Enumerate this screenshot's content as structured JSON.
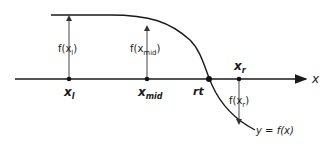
{
  "diagram": {
    "axis_label": "x",
    "curve_label": "y = f(x)",
    "points": {
      "x_l": {
        "base": "x",
        "sub": "l"
      },
      "x_mid": {
        "base": "x",
        "sub": "mid"
      },
      "rt": {
        "label": "rt"
      },
      "x_r": {
        "base": "x",
        "sub": "r"
      }
    },
    "arrow_labels": {
      "f_xl": {
        "prefix": "f(x",
        "sub": "l",
        "suffix": ")"
      },
      "f_xmid": {
        "prefix": "f(x",
        "sub": "mid",
        "suffix": ")"
      },
      "f_xr": {
        "prefix": "f(x",
        "sub": "r",
        "suffix": ")"
      }
    },
    "colors": {
      "line": "#1a1a1a",
      "arrow": "#444444"
    }
  }
}
